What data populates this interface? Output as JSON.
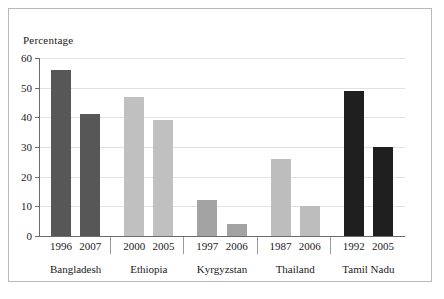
{
  "chart_data": {
    "type": "bar",
    "title": "",
    "ylabel": "Percentage",
    "xlabel": "",
    "ylim": [
      0,
      60
    ],
    "yticks": [
      0,
      10,
      20,
      30,
      40,
      50,
      60
    ],
    "grid": true,
    "legend": "none",
    "categories": [
      "1996",
      "2007",
      "2000",
      "2005",
      "1997",
      "2006",
      "1987",
      "2006",
      "1992",
      "2005"
    ],
    "values": [
      56,
      41,
      47,
      39,
      12,
      4,
      26,
      10,
      49,
      30
    ],
    "groups": [
      {
        "name": "Bangladesh",
        "color": "#575757",
        "bars": [
          {
            "year": "1996",
            "value": 56
          },
          {
            "year": "2007",
            "value": 41
          }
        ]
      },
      {
        "name": "Ethiopia",
        "color": "#c0c0c0",
        "bars": [
          {
            "year": "2000",
            "value": 47
          },
          {
            "year": "2005",
            "value": 39
          }
        ]
      },
      {
        "name": "Kyrgyzstan",
        "color": "#a3a3a3",
        "bars": [
          {
            "year": "1997",
            "value": 12
          },
          {
            "year": "2006",
            "value": 4
          }
        ]
      },
      {
        "name": "Thailand",
        "color": "#bdbdbd",
        "bars": [
          {
            "year": "1987",
            "value": 26
          },
          {
            "year": "2006",
            "value": 10
          }
        ]
      },
      {
        "name": "Tamil Nadu",
        "color": "#1f1f1f",
        "bars": [
          {
            "year": "1992",
            "value": 49
          },
          {
            "year": "2005",
            "value": 30
          }
        ]
      }
    ]
  },
  "axis": {
    "y_title": "Percentage"
  },
  "colors": {
    "frame": "#b8b8b8",
    "grid": "#e2e2e2",
    "axis": "#6b6b6b",
    "text": "#1a1a1a",
    "background": "#ffffff"
  }
}
